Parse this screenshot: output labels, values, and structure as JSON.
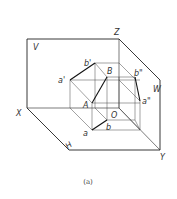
{
  "figure": {
    "caption": "(a)",
    "planes": {
      "V": "V",
      "H": "H",
      "W": "W"
    },
    "axes": {
      "X": "X",
      "Y": "Y",
      "Z": "Z",
      "origin": "O"
    },
    "points": {
      "A": "A",
      "B": "B",
      "a": "a",
      "b": "b",
      "a_prime": "a'",
      "b_prime": "b'",
      "a_double_prime": "a\"",
      "b_double_prime": "b\""
    }
  }
}
